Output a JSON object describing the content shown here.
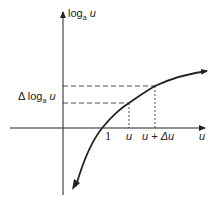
{
  "diagram": {
    "y_axis_label": {
      "prefix": "log",
      "sub": "a",
      "var": "u"
    },
    "x_axis_label": "u",
    "delta_label": {
      "prefix": "Δ log",
      "sub": "a",
      "var": "u"
    },
    "tick_one": "1",
    "tick_u": "u",
    "tick_u_delta": "u + Δu",
    "colors": {
      "stroke": "#222222",
      "background": "#ffffff"
    }
  }
}
